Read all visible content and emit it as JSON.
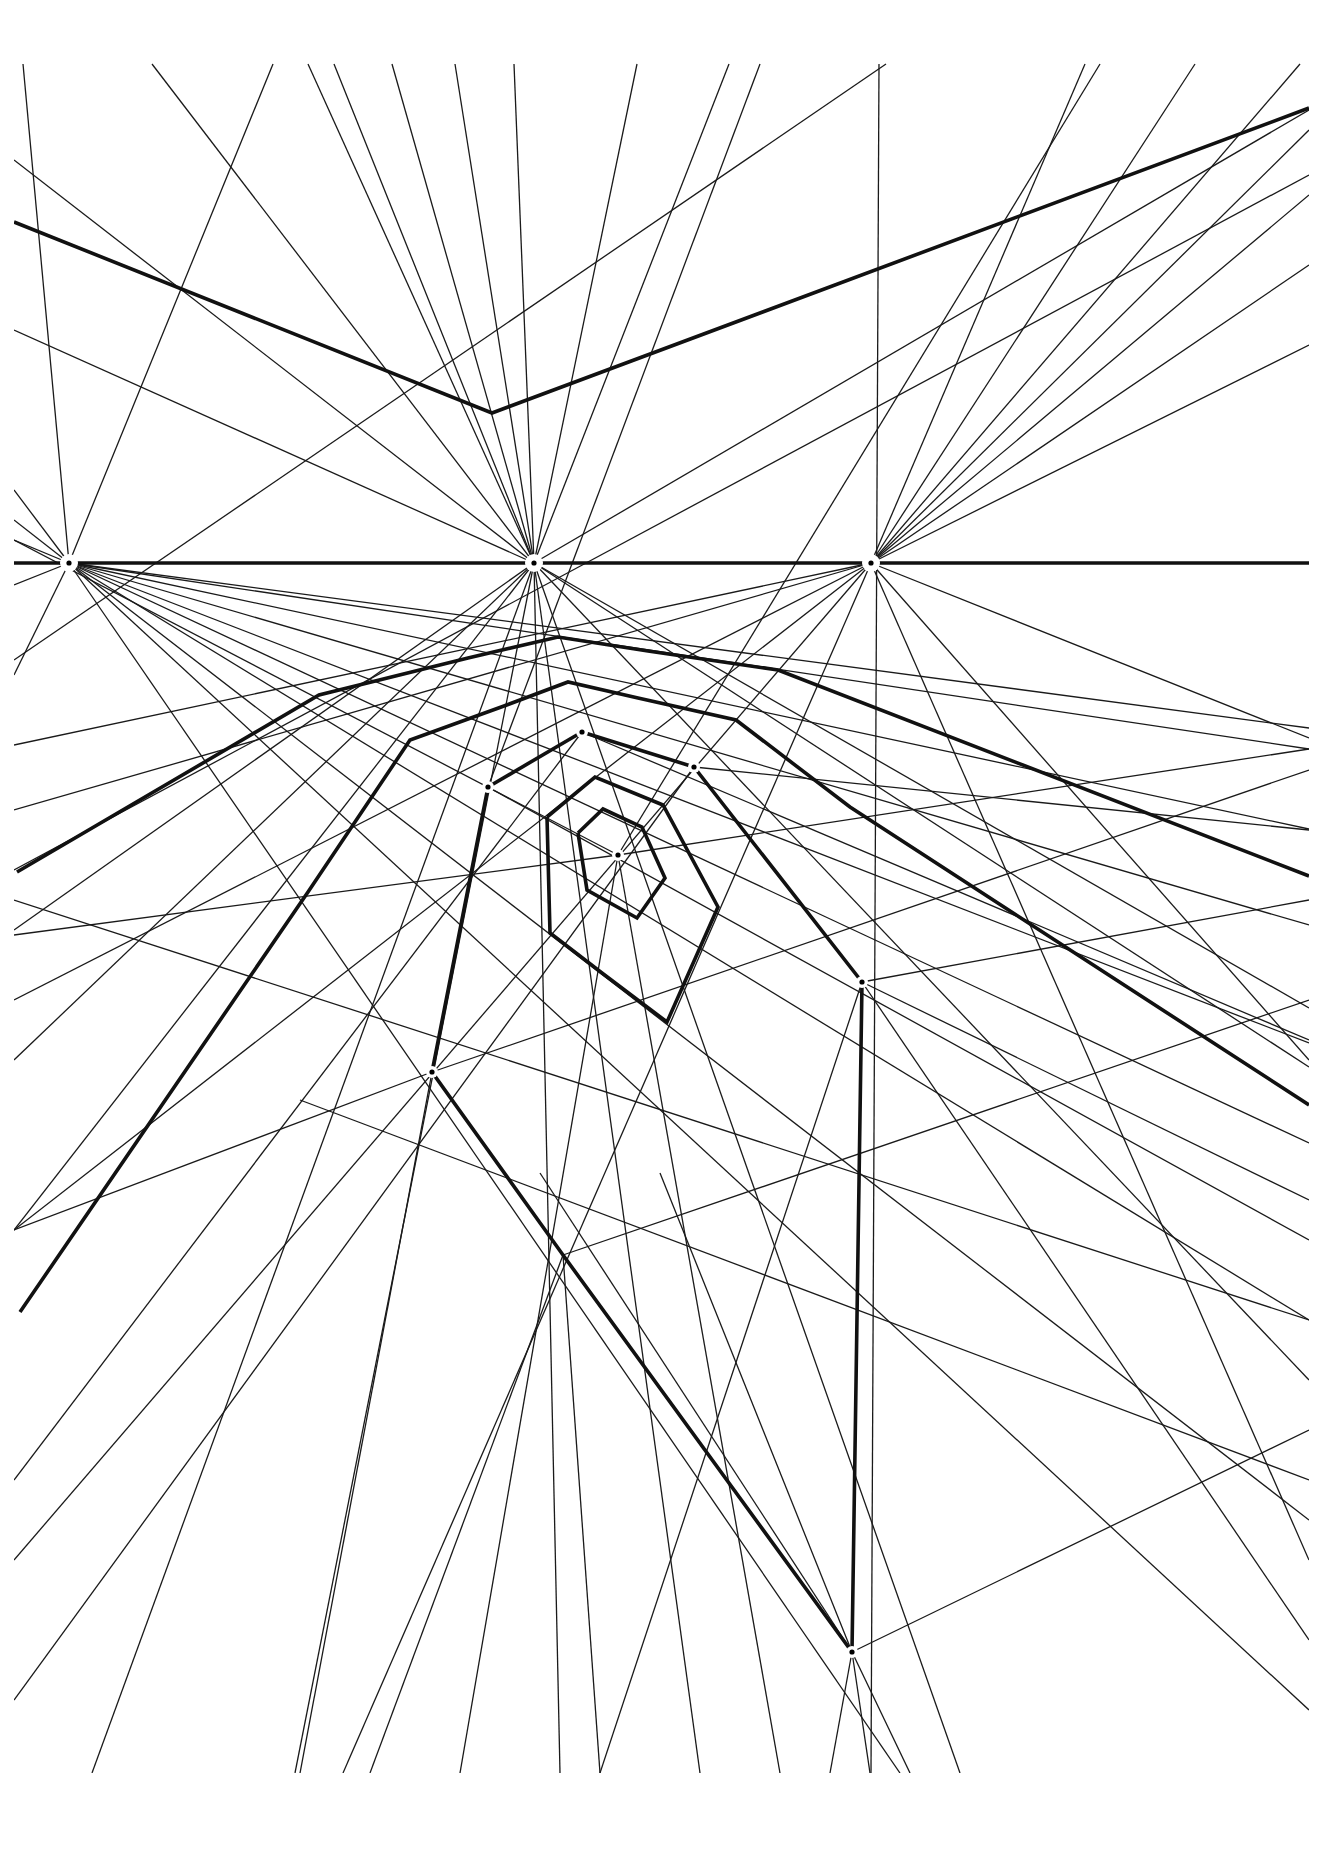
{
  "diagram": {
    "type": "perspective-construction",
    "background": "#ffffff",
    "ink": "#111111",
    "frame": {
      "x0": 14,
      "y0": 62,
      "x1": 1309,
      "y1": 1773
    },
    "horizon_y": 563,
    "vanishing_points": [
      {
        "name": "left-vanishing-point",
        "x": 69,
        "y": 563,
        "halo": 9
      },
      {
        "name": "center-vanishing-point",
        "x": 534,
        "y": 563,
        "halo": 9
      },
      {
        "name": "right-vanishing-point",
        "x": 871,
        "y": 563,
        "halo": 9
      },
      {
        "name": "spiral-center-point",
        "x": 618,
        "y": 855,
        "halo": 6
      },
      {
        "name": "node-a",
        "x": 582,
        "y": 732,
        "halo": 6
      },
      {
        "name": "node-b",
        "x": 694,
        "y": 767,
        "halo": 6
      },
      {
        "name": "node-c",
        "x": 488,
        "y": 787,
        "halo": 6
      },
      {
        "name": "node-d",
        "x": 862,
        "y": 982,
        "halo": 6
      },
      {
        "name": "node-e",
        "x": 432,
        "y": 1072,
        "halo": 6
      },
      {
        "name": "node-bottom",
        "x": 852,
        "y": 1652,
        "halo": 6
      }
    ],
    "thick_paths": [
      {
        "name": "horizon-line",
        "points": [
          [
            14,
            563
          ],
          [
            1309,
            563
          ]
        ]
      },
      {
        "name": "top-roof-line",
        "points": [
          [
            14,
            222
          ],
          [
            492,
            413
          ],
          [
            1309,
            108
          ]
        ]
      },
      {
        "name": "ring-5-arc",
        "points": [
          [
            17,
            872
          ],
          [
            319,
            695
          ],
          [
            468,
            658
          ],
          [
            558,
            637
          ],
          [
            648,
            651
          ],
          [
            778,
            670
          ],
          [
            1309,
            876
          ]
        ]
      },
      {
        "name": "ring-4-arc",
        "points": [
          [
            20,
            1312
          ],
          [
            308,
            892
          ],
          [
            410,
            740
          ],
          [
            504,
            706
          ],
          [
            568,
            682
          ],
          [
            638,
            698
          ],
          [
            736,
            720
          ],
          [
            850,
            807
          ],
          [
            1309,
            1105
          ]
        ]
      },
      {
        "name": "ring-3-left",
        "points": [
          [
            488,
            787
          ],
          [
            432,
            1072
          ],
          [
            563,
            1255
          ],
          [
            852,
            1652
          ]
        ]
      },
      {
        "name": "ring-3-top",
        "points": [
          [
            582,
            732
          ],
          [
            694,
            767
          ],
          [
            862,
            982
          ],
          [
            852,
            1652
          ]
        ]
      },
      {
        "name": "ring-3-upper-left",
        "points": [
          [
            488,
            787
          ],
          [
            582,
            732
          ]
        ]
      },
      {
        "name": "ring-2",
        "points": [
          [
            547,
            817
          ],
          [
            595,
            777
          ],
          [
            663,
            805
          ],
          [
            718,
            907
          ],
          [
            667,
            1022
          ],
          [
            602,
            973
          ],
          [
            550,
            933
          ],
          [
            547,
            817
          ]
        ]
      },
      {
        "name": "ring-1",
        "points": [
          [
            578,
            833
          ],
          [
            603,
            809
          ],
          [
            642,
            827
          ],
          [
            665,
            878
          ],
          [
            637,
            918
          ],
          [
            587,
            890
          ],
          [
            578,
            833
          ]
        ]
      }
    ],
    "thin_lines": [
      [
        [
          23,
          64
        ],
        [
          69,
          563
        ]
      ],
      [
        [
          152,
          64
        ],
        [
          534,
          563
        ]
      ],
      [
        [
          273,
          64
        ],
        [
          69,
          563
        ]
      ],
      [
        [
          308,
          64
        ],
        [
          534,
          563
        ]
      ],
      [
        [
          334,
          64
        ],
        [
          534,
          563
        ]
      ],
      [
        [
          392,
          64
        ],
        [
          534,
          563
        ]
      ],
      [
        [
          455,
          64
        ],
        [
          534,
          563
        ]
      ],
      [
        [
          514,
          64
        ],
        [
          534,
          563
        ]
      ],
      [
        [
          637,
          64
        ],
        [
          534,
          563
        ]
      ],
      [
        [
          729,
          64
        ],
        [
          534,
          563
        ]
      ],
      [
        [
          879,
          64
        ],
        [
          871,
          1773
        ]
      ],
      [
        [
          886,
          64
        ],
        [
          14,
          660
        ]
      ],
      [
        [
          1085,
          64
        ],
        [
          871,
          563
        ]
      ],
      [
        [
          1195,
          64
        ],
        [
          871,
          563
        ]
      ],
      [
        [
          1300,
          64
        ],
        [
          871,
          563
        ]
      ],
      [
        [
          14,
          160
        ],
        [
          534,
          563
        ]
      ],
      [
        [
          14,
          330
        ],
        [
          534,
          563
        ]
      ],
      [
        [
          14,
          490
        ],
        [
          69,
          563
        ]
      ],
      [
        [
          14,
          520
        ],
        [
          69,
          563
        ]
      ],
      [
        [
          14,
          540
        ],
        [
          69,
          563
        ]
      ],
      [
        [
          14,
          585
        ],
        [
          69,
          563
        ]
      ],
      [
        [
          14,
          675
        ],
        [
          69,
          563
        ]
      ],
      [
        [
          1309,
          130
        ],
        [
          871,
          563
        ]
      ],
      [
        [
          1309,
          195
        ],
        [
          871,
          563
        ]
      ],
      [
        [
          1309,
          265
        ],
        [
          871,
          563
        ]
      ],
      [
        [
          1309,
          345
        ],
        [
          871,
          563
        ]
      ],
      [
        [
          1309,
          110
        ],
        [
          534,
          563
        ]
      ],
      [
        [
          1309,
          175
        ],
        [
          14,
          870
        ]
      ],
      [
        [
          69,
          563
        ],
        [
          1309,
          728
        ]
      ],
      [
        [
          69,
          563
        ],
        [
          1309,
          749
        ]
      ],
      [
        [
          69,
          563
        ],
        [
          1309,
          829
        ]
      ],
      [
        [
          69,
          563
        ],
        [
          1309,
          925
        ]
      ],
      [
        [
          69,
          563
        ],
        [
          1309,
          1043
        ]
      ],
      [
        [
          69,
          563
        ],
        [
          1309,
          1143
        ]
      ],
      [
        [
          69,
          563
        ],
        [
          1309,
          1320
        ]
      ],
      [
        [
          69,
          563
        ],
        [
          1309,
          1520
        ]
      ],
      [
        [
          69,
          563
        ],
        [
          1309,
          1710
        ]
      ],
      [
        [
          69,
          563
        ],
        [
          900,
          1773
        ]
      ],
      [
        [
          534,
          563
        ],
        [
          14,
          930
        ]
      ],
      [
        [
          534,
          563
        ],
        [
          14,
          1060
        ]
      ],
      [
        [
          534,
          563
        ],
        [
          14,
          1230
        ]
      ],
      [
        [
          534,
          563
        ],
        [
          92,
          1773
        ]
      ],
      [
        [
          534,
          563
        ],
        [
          295,
          1773
        ]
      ],
      [
        [
          534,
          563
        ],
        [
          560,
          1773
        ]
      ],
      [
        [
          534,
          563
        ],
        [
          700,
          1773
        ]
      ],
      [
        [
          534,
          563
        ],
        [
          960,
          1773
        ]
      ],
      [
        [
          534,
          563
        ],
        [
          1309,
          1008
        ]
      ],
      [
        [
          534,
          563
        ],
        [
          1309,
          1067
        ]
      ],
      [
        [
          534,
          563
        ],
        [
          1309,
          1380
        ]
      ],
      [
        [
          871,
          563
        ],
        [
          14,
          745
        ]
      ],
      [
        [
          871,
          563
        ],
        [
          14,
          810
        ]
      ],
      [
        [
          871,
          563
        ],
        [
          14,
          1000
        ]
      ],
      [
        [
          871,
          563
        ],
        [
          14,
          1230
        ]
      ],
      [
        [
          871,
          563
        ],
        [
          14,
          1560
        ]
      ],
      [
        [
          871,
          563
        ],
        [
          343,
          1773
        ]
      ],
      [
        [
          871,
          563
        ],
        [
          1309,
          738
        ]
      ],
      [
        [
          871,
          563
        ],
        [
          1309,
          1060
        ]
      ],
      [
        [
          871,
          563
        ],
        [
          1309,
          1560
        ]
      ],
      [
        [
          618,
          855
        ],
        [
          14,
          935
        ]
      ],
      [
        [
          618,
          855
        ],
        [
          1309,
          749
        ]
      ],
      [
        [
          618,
          855
        ],
        [
          460,
          1773
        ]
      ],
      [
        [
          618,
          855
        ],
        [
          780,
          1773
        ]
      ],
      [
        [
          618,
          855
        ],
        [
          14,
          540
        ]
      ],
      [
        [
          618,
          855
        ],
        [
          1100,
          64
        ]
      ],
      [
        [
          582,
          732
        ],
        [
          14,
          1480
        ]
      ],
      [
        [
          582,
          732
        ],
        [
          1309,
          1040
        ]
      ],
      [
        [
          694,
          767
        ],
        [
          14,
          1700
        ]
      ],
      [
        [
          694,
          767
        ],
        [
          1309,
          830
        ]
      ],
      [
        [
          488,
          787
        ],
        [
          1309,
          1240
        ]
      ],
      [
        [
          488,
          787
        ],
        [
          760,
          64
        ]
      ],
      [
        [
          432,
          1072
        ],
        [
          300,
          1773
        ]
      ],
      [
        [
          432,
          1072
        ],
        [
          14,
          1230
        ]
      ],
      [
        [
          432,
          1072
        ],
        [
          1309,
          770
        ]
      ],
      [
        [
          563,
          1255
        ],
        [
          600,
          1773
        ]
      ],
      [
        [
          563,
          1255
        ],
        [
          370,
          1773
        ]
      ],
      [
        [
          563,
          1255
        ],
        [
          1309,
          1000
        ]
      ],
      [
        [
          862,
          982
        ],
        [
          1309,
          1640
        ]
      ],
      [
        [
          862,
          982
        ],
        [
          1309,
          1200
        ]
      ],
      [
        [
          862,
          982
        ],
        [
          600,
          1773
        ]
      ],
      [
        [
          862,
          982
        ],
        [
          1309,
          900
        ]
      ],
      [
        [
          852,
          1652
        ],
        [
          830,
          1773
        ]
      ],
      [
        [
          852,
          1652
        ],
        [
          870,
          1773
        ]
      ],
      [
        [
          852,
          1652
        ],
        [
          910,
          1773
        ]
      ],
      [
        [
          852,
          1652
        ],
        [
          540,
          1173
        ]
      ],
      [
        [
          852,
          1652
        ],
        [
          660,
          1173
        ]
      ],
      [
        [
          852,
          1652
        ],
        [
          1309,
          1430
        ]
      ],
      [
        [
          1309,
          1320
        ],
        [
          14,
          900
        ]
      ],
      [
        [
          1309,
          1480
        ],
        [
          300,
          1100
        ]
      ]
    ]
  }
}
